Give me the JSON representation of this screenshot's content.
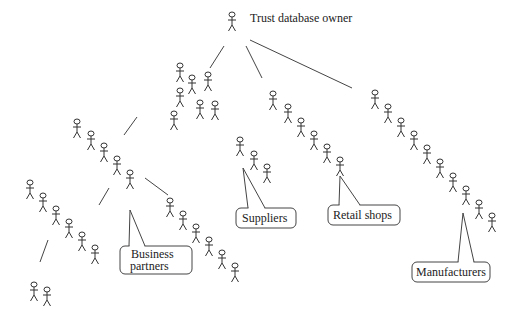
{
  "diagram": {
    "title": "Trust database owner",
    "root": {
      "label": "Trust database owner",
      "x": 232,
      "y": 12
    },
    "edges": [
      [
        224,
        46,
        210,
        68
      ],
      [
        246,
        46,
        262,
        78
      ],
      [
        250,
        40,
        352,
        88
      ],
      [
        137,
        117,
        124,
        135
      ],
      [
        109,
        188,
        99,
        205
      ],
      [
        145,
        178,
        168,
        195
      ],
      [
        48,
        240,
        40,
        262
      ]
    ],
    "groups": [
      {
        "name": "root",
        "figures": [
          [
            232,
            12
          ]
        ]
      },
      {
        "name": "upper-cluster",
        "figures": [
          [
            180,
            63
          ],
          [
            192,
            75
          ],
          [
            208,
            72
          ],
          [
            180,
            88
          ],
          [
            200,
            100
          ],
          [
            215,
            101
          ],
          [
            174,
            111
          ]
        ]
      },
      {
        "name": "business-partners-branch-a",
        "figures": [
          [
            77,
            119
          ],
          [
            91,
            131
          ],
          [
            104,
            143
          ],
          [
            117,
            156
          ],
          [
            130,
            170
          ]
        ]
      },
      {
        "name": "business-partners-branch-b",
        "figures": [
          [
            30,
            180
          ],
          [
            43,
            193
          ],
          [
            56,
            206
          ],
          [
            69,
            219
          ],
          [
            82,
            232
          ],
          [
            95,
            245
          ]
        ]
      },
      {
        "name": "business-partners-branch-c",
        "figures": [
          [
            34,
            282
          ],
          [
            47,
            287
          ]
        ]
      },
      {
        "name": "business-partners-branch-d",
        "figures": [
          [
            170,
            198
          ],
          [
            183,
            211
          ],
          [
            196,
            224
          ],
          [
            209,
            237
          ],
          [
            222,
            250
          ],
          [
            235,
            263
          ]
        ]
      },
      {
        "name": "suppliers-branch",
        "figures": [
          [
            240,
            137
          ],
          [
            254,
            151
          ],
          [
            267,
            164
          ]
        ]
      },
      {
        "name": "retail-branch",
        "figures": [
          [
            273,
            91
          ],
          [
            288,
            104
          ],
          [
            301,
            118
          ],
          [
            314,
            131
          ],
          [
            327,
            144
          ],
          [
            340,
            157
          ]
        ]
      },
      {
        "name": "manufacturers-branch",
        "figures": [
          [
            375,
            90
          ],
          [
            388,
            104
          ],
          [
            401,
            118
          ],
          [
            414,
            131
          ],
          [
            427,
            145
          ],
          [
            440,
            159
          ],
          [
            453,
            173
          ],
          [
            466,
            186
          ],
          [
            479,
            200
          ],
          [
            492,
            213
          ]
        ]
      }
    ],
    "callouts": [
      {
        "id": "business-partners",
        "lines": [
          "Business",
          "partners"
        ],
        "box": [
          120,
          246,
          72,
          28
        ],
        "tip": [
          130,
          210
        ],
        "base": [
          129,
          246,
          145,
          246
        ]
      },
      {
        "id": "suppliers",
        "lines": [
          "Suppliers"
        ],
        "box": [
          236,
          208,
          60,
          20
        ],
        "tip": [
          243,
          168
        ],
        "base": [
          248,
          208,
          265,
          208
        ]
      },
      {
        "id": "retail-shops",
        "lines": [
          "Retail shops"
        ],
        "box": [
          328,
          205,
          72,
          20
        ],
        "tip": [
          340,
          176
        ],
        "base": [
          339,
          205,
          360,
          205
        ]
      },
      {
        "id": "manufacturers",
        "lines": [
          "Manufacturers"
        ],
        "box": [
          412,
          262,
          78,
          20
        ],
        "tip": [
          463,
          213
        ],
        "base": [
          458,
          262,
          474,
          262
        ]
      }
    ]
  },
  "labels": {
    "root": "Trust database owner",
    "business_partners_1": "Business",
    "business_partners_2": "partners",
    "suppliers": "Suppliers",
    "retail_shops": "Retail shops",
    "manufacturers": "Manufacturers"
  }
}
